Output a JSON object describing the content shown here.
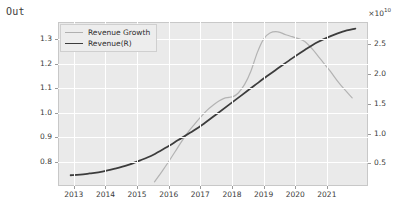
{
  "cell": {
    "output_prefix": "Out"
  },
  "chart_data": {
    "type": "line",
    "title": "",
    "xlabel": "",
    "ylabel": "",
    "grid": true,
    "legend_position": "upper left",
    "x_tick_labels": [
      "2013",
      "2014",
      "2015",
      "2016",
      "2017",
      "2018",
      "2019",
      "2020",
      "2021"
    ],
    "x_tick_values": [
      2013,
      2014,
      2015,
      2016,
      2017,
      2018,
      2019,
      2020,
      2021
    ],
    "xlim": [
      2012.5,
      2022.3
    ],
    "left_axis": {
      "label": "",
      "tick_labels": [
        "0.8",
        "0.9",
        "1.0",
        "1.1",
        "1.2",
        "1.3"
      ],
      "tick_values": [
        0.8,
        0.9,
        1.0,
        1.1,
        1.2,
        1.3
      ],
      "ylim": [
        0.7,
        1.37
      ]
    },
    "right_axis": {
      "label": "",
      "exponent_label": "×10",
      "exponent_power": "10",
      "tick_labels": [
        "0.5",
        "1.0",
        "1.5",
        "2.0",
        "2.5"
      ],
      "tick_values": [
        0.5,
        1.0,
        1.5,
        2.0,
        2.5
      ],
      "ylim": [
        0.12,
        2.87
      ]
    },
    "series": [
      {
        "name": "Revenue Growth",
        "axis": "left",
        "color": "#b3b3b3",
        "x": [
          2015.55,
          2015.8,
          2016.0,
          2016.2,
          2016.4,
          2016.6,
          2016.8,
          2017.0,
          2017.2,
          2017.4,
          2017.6,
          2017.75,
          2017.9,
          2018.05,
          2018.2,
          2018.4,
          2018.6,
          2018.8,
          2019.0,
          2019.2,
          2019.45,
          2019.7,
          2019.9,
          2020.1,
          2020.3,
          2020.55,
          2020.8,
          2021.1,
          2021.4,
          2021.8
        ],
        "y": [
          0.717,
          0.762,
          0.8,
          0.84,
          0.88,
          0.918,
          0.95,
          0.98,
          1.008,
          1.03,
          1.048,
          1.058,
          1.062,
          1.066,
          1.08,
          1.115,
          1.17,
          1.245,
          1.3,
          1.325,
          1.33,
          1.318,
          1.31,
          1.302,
          1.29,
          1.258,
          1.218,
          1.17,
          1.118,
          1.06
        ]
      },
      {
        "name": "Revenue(R)",
        "axis": "right",
        "color": "#3c3c3c",
        "x": [
          2012.9,
          2013.2,
          2013.5,
          2013.9,
          2014.3,
          2014.7,
          2015.1,
          2015.5,
          2015.9,
          2016.3,
          2016.7,
          2017.1,
          2017.5,
          2017.9,
          2018.3,
          2018.7,
          2019.1,
          2019.5,
          2019.9,
          2020.3,
          2020.7,
          2021.1,
          2021.5,
          2021.9
        ],
        "y": [
          0.3,
          0.31,
          0.33,
          0.36,
          0.41,
          0.47,
          0.55,
          0.64,
          0.76,
          0.89,
          1.02,
          1.16,
          1.32,
          1.48,
          1.64,
          1.8,
          1.96,
          2.11,
          2.26,
          2.4,
          2.53,
          2.63,
          2.71,
          2.76
        ]
      }
    ],
    "legend_entries": [
      "Revenue Growth",
      "Revenue(R)"
    ]
  },
  "style": {
    "plot_background": "#eaeaea",
    "figure_background": "#ffffff",
    "gridline_color": "#ffffff",
    "growth_color": "#b3b3b3",
    "revenue_color": "#3c3c3c",
    "tick_text_color": "#3a3a3a"
  }
}
